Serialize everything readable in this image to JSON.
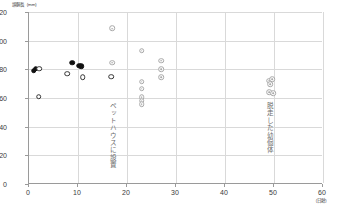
{
  "axes": {
    "y_unit_label": "頭胴長（mm）",
    "x_unit_label": "（日齢）"
  },
  "chart_data": {
    "type": "scatter",
    "title": "",
    "xlabel": "（日齢）",
    "ylabel": "頭胴長（mm）",
    "xlim": [
      0,
      60
    ],
    "ylim": [
      0,
      120
    ],
    "xticks": [
      0,
      10,
      20,
      30,
      40,
      50,
      60
    ],
    "yticks": [
      0,
      20,
      40,
      60,
      80,
      100,
      120
    ],
    "grid": true,
    "legend_position": "none",
    "series": [
      {
        "name": "filled-circle",
        "marker": "filled circle (black)",
        "color": "#111111",
        "points": [
          {
            "x": 1.0,
            "y": 79.0
          },
          {
            "x": 1.4,
            "y": 80.5
          },
          {
            "x": 8.8,
            "y": 84.5
          },
          {
            "x": 10.2,
            "y": 82.5
          },
          {
            "x": 10.6,
            "y": 82.0
          }
        ]
      },
      {
        "name": "open-circle",
        "marker": "open circle (white, black outline)",
        "color": "#333333",
        "points": [
          {
            "x": 2.1,
            "y": 80.5
          },
          {
            "x": 2.0,
            "y": 61.0
          },
          {
            "x": 7.8,
            "y": 77.0
          },
          {
            "x": 11.0,
            "y": 74.5
          },
          {
            "x": 16.8,
            "y": 75.0
          }
        ]
      },
      {
        "name": "gray-donut",
        "marker": "gray ringed circle",
        "color": "#a8a8a8",
        "points": [
          {
            "x": 17.0,
            "y": 108.5
          },
          {
            "x": 17.0,
            "y": 84.5
          },
          {
            "x": 23.0,
            "y": 93.0
          },
          {
            "x": 23.0,
            "y": 71.5
          },
          {
            "x": 23.0,
            "y": 66.5
          },
          {
            "x": 23.0,
            "y": 60.5
          },
          {
            "x": 23.0,
            "y": 58.0
          },
          {
            "x": 23.0,
            "y": 55.5
          },
          {
            "x": 27.0,
            "y": 86.0
          },
          {
            "x": 27.0,
            "y": 80.0
          },
          {
            "x": 27.0,
            "y": 74.5
          },
          {
            "x": 49.0,
            "y": 72.0
          },
          {
            "x": 49.6,
            "y": 73.0
          },
          {
            "x": 49.2,
            "y": 69.5
          },
          {
            "x": 49.0,
            "y": 64.0
          },
          {
            "x": 49.8,
            "y": 63.5
          }
        ]
      }
    ],
    "annotations": [
      {
        "text": "ペットハウスに設置",
        "x": 17.0,
        "y_top": 57.0,
        "orientation": "vertical"
      },
      {
        "text": "脱走した幼個体",
        "x": 49.0,
        "y_top": 57.0,
        "orientation": "vertical"
      }
    ]
  }
}
